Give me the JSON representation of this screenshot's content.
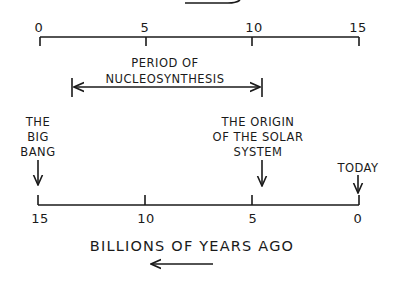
{
  "diagram": {
    "top_axis": {
      "ticks": [
        "0",
        "5",
        "10",
        "15"
      ],
      "range": [
        0,
        15
      ],
      "direction": "left-to-right"
    },
    "nucleosynthesis": {
      "label_line1": "PERIOD OF",
      "label_line2": "NUCLEOSYNTHESIS",
      "start": 1.5,
      "end": 10.5
    },
    "events": [
      {
        "id": "big-bang",
        "lines": [
          "THE",
          "BIG",
          "BANG"
        ],
        "years_ago": 15
      },
      {
        "id": "solar-system",
        "lines": [
          "THE ORIGIN",
          "OF THE SOLAR",
          "SYSTEM"
        ],
        "years_ago": 4.5
      },
      {
        "id": "today",
        "lines": [
          "TODAY"
        ],
        "years_ago": 0
      }
    ],
    "bottom_axis": {
      "ticks": [
        "15",
        "10",
        "5",
        "0"
      ],
      "range": [
        15,
        0
      ],
      "title": "BILLIONS OF YEARS AGO",
      "direction_arrow": "left"
    }
  }
}
